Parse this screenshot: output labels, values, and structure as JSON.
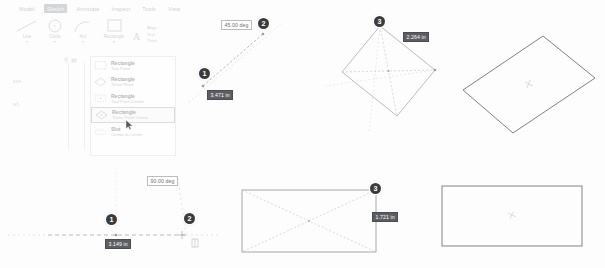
{
  "app": {
    "title": "CAD Sketch Rectangle Tool Tutorial"
  },
  "ribbon": {
    "tabs": [
      {
        "label": "Model",
        "active": false
      },
      {
        "label": "Sketch",
        "active": true
      },
      {
        "label": "Annotate",
        "active": false
      },
      {
        "label": "Inspect",
        "active": false
      },
      {
        "label": "Tools",
        "active": false
      },
      {
        "label": "View",
        "active": false
      }
    ],
    "tools": [
      {
        "label": "Line",
        "icon": "line-icon"
      },
      {
        "label": "Circle",
        "icon": "circle-icon"
      },
      {
        "label": "Arc",
        "icon": "arc-icon"
      },
      {
        "label": "Rectangle",
        "icon": "rectangle-icon"
      }
    ],
    "text_group": [
      {
        "label": "Align",
        "icon": "align-icon"
      },
      {
        "label": "Text",
        "icon": "text-icon"
      },
      {
        "label": "Point",
        "icon": "point-icon"
      }
    ],
    "dropdown_caret": "▾"
  },
  "browser": {
    "search_icon": "search-icon",
    "filter_icon": "filter-icon",
    "nodes": [
      {
        "label": "ture"
      },
      {
        "label": "w1"
      }
    ]
  },
  "gallery": {
    "items": [
      {
        "title": "Rectangle",
        "subtitle": "Two Point",
        "icon": "rect-two-point-icon",
        "selected": false
      },
      {
        "title": "Rectangle",
        "subtitle": "Three Point",
        "icon": "rect-three-point-icon",
        "selected": false
      },
      {
        "title": "Rectangle",
        "subtitle": "Two Point Center",
        "icon": "rect-two-point-center-icon",
        "selected": false
      },
      {
        "title": "Rectangle",
        "subtitle": "Three Point Center",
        "icon": "rect-three-point-center-icon",
        "selected": true
      },
      {
        "title": "Slot",
        "subtitle": "Center to Center",
        "icon": "slot-center-icon",
        "selected": false
      }
    ]
  },
  "figures": {
    "top_left": {
      "name": "three-point-center-step-1-2",
      "badges": [
        {
          "label": "1"
        },
        {
          "label": "2"
        }
      ],
      "dimensions": [
        {
          "value": "45.00 deg",
          "active": false
        },
        {
          "value": "3.471 in",
          "active": true
        }
      ]
    },
    "top_middle": {
      "name": "three-point-center-step-3",
      "badges": [
        {
          "label": "3"
        }
      ],
      "dimensions": [
        {
          "value": "2.264 in",
          "active": true
        }
      ]
    },
    "top_right": {
      "name": "rotated-rectangle-result",
      "center_marker": "center-point-icon"
    },
    "bottom_left": {
      "name": "two-point-center-step-1-2",
      "badges": [
        {
          "label": "1"
        },
        {
          "label": "2"
        }
      ],
      "dimensions": [
        {
          "value": "90.00 deg",
          "active": false
        },
        {
          "value": "3.149 in",
          "active": true
        }
      ]
    },
    "bottom_middle": {
      "name": "two-point-center-step-3",
      "badges": [
        {
          "label": "3"
        }
      ],
      "dimensions": [
        {
          "value": "1.721 in",
          "active": true
        }
      ]
    },
    "bottom_right": {
      "name": "axis-aligned-rectangle-result",
      "center_marker": "center-point-icon"
    }
  },
  "colors": {
    "badge_fill": "#3b3b3b",
    "dim_active_bg": "#5c5e63",
    "geometry_stroke": "#8a8c91",
    "construction_stroke": "#bfc1c6",
    "tab_active_bg": "#9aa0a6"
  }
}
